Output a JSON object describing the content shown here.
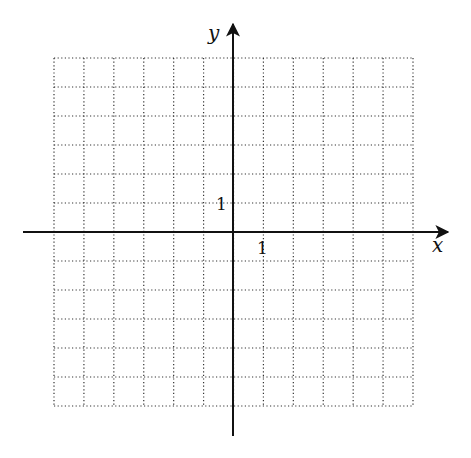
{
  "diagram": {
    "type": "coordinate-grid",
    "x_axis_label": "x",
    "y_axis_label": "y",
    "x_tick_label": "1",
    "y_tick_label": "1",
    "grid": {
      "cols": 12,
      "rows": 12,
      "x_min": -6,
      "x_max": 6,
      "y_min": -6,
      "y_max": 6,
      "line_style": "dotted"
    },
    "colors": {
      "axis": "#111111",
      "grid": "#333333",
      "background": "#ffffff"
    }
  }
}
